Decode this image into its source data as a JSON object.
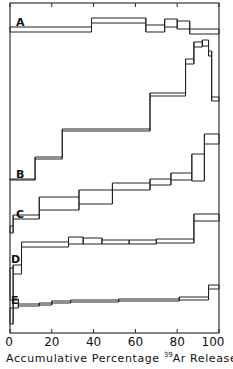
{
  "chart_data": {
    "type": "line",
    "subtype": "step (age spectra, stacked panels)",
    "title": "",
    "xlabel_prefix": "Accumulative Percentage ",
    "xlabel_sup": "39",
    "xlabel_suffix": "Ar Released",
    "ylabel": "",
    "xlim": [
      0,
      100
    ],
    "x_ticks": [
      0,
      20,
      40,
      60,
      80,
      100
    ],
    "x_tick_labels": [
      "0",
      "20",
      "40",
      "60",
      "80",
      "100"
    ],
    "grid": false,
    "legend": "none",
    "note": "Step boxes: each step spans [x0,x1] in % 39Ar released; y values are pixel-relative vertical positions (no y-axis scale shown). Each step is drawn as a box with top and bottom error bounds.",
    "series": [
      {
        "name": "A",
        "label_pos": [
          16,
          16
        ],
        "steps": [
          {
            "x0": 0,
            "x1": 39,
            "top": 27,
            "bot": 32
          },
          {
            "x0": 39,
            "x1": 65,
            "top": 18,
            "bot": 23
          },
          {
            "x0": 65,
            "x1": 74,
            "top": 25,
            "bot": 32
          },
          {
            "x0": 74,
            "x1": 80,
            "top": 19,
            "bot": 27
          },
          {
            "x0": 80,
            "x1": 86,
            "top": 21,
            "bot": 29
          },
          {
            "x0": 86,
            "x1": 100,
            "top": 29,
            "bot": 34
          }
        ]
      },
      {
        "name": "B",
        "label_pos": [
          16,
          168
        ],
        "steps": [
          {
            "x0": 0,
            "x1": 12,
            "top": 179,
            "bot": 180
          },
          {
            "x0": 12,
            "x1": 25,
            "top": 157,
            "bot": 159
          },
          {
            "x0": 25,
            "x1": 67,
            "top": 129,
            "bot": 131
          },
          {
            "x0": 67,
            "x1": 84,
            "top": 93,
            "bot": 96
          },
          {
            "x0": 84,
            "x1": 88,
            "top": 59,
            "bot": 64
          },
          {
            "x0": 88,
            "x1": 92,
            "top": 42,
            "bot": 47
          },
          {
            "x0": 92,
            "x1": 95,
            "top": 40,
            "bot": 46
          },
          {
            "x0": 95,
            "x1": 96.5,
            "top": 51,
            "bot": 56
          },
          {
            "x0": 96.5,
            "x1": 100,
            "top": 97,
            "bot": 101
          }
        ]
      },
      {
        "name": "C",
        "label_pos": [
          16,
          208
        ],
        "steps": [
          {
            "x0": 0,
            "x1": 1.5,
            "top": 226,
            "bot": 233
          },
          {
            "x0": 1.5,
            "x1": 14,
            "top": 215,
            "bot": 219
          },
          {
            "x0": 14,
            "x1": 33,
            "top": 197,
            "bot": 210
          },
          {
            "x0": 33,
            "x1": 49,
            "top": 190,
            "bot": 204
          },
          {
            "x0": 49,
            "x1": 67,
            "top": 183,
            "bot": 190
          },
          {
            "x0": 67,
            "x1": 77,
            "top": 179,
            "bot": 185
          },
          {
            "x0": 77,
            "x1": 87,
            "top": 173,
            "bot": 180
          },
          {
            "x0": 87,
            "x1": 93,
            "top": 154,
            "bot": 181
          },
          {
            "x0": 93,
            "x1": 100,
            "top": 134,
            "bot": 144
          }
        ]
      },
      {
        "name": "D",
        "label_pos": [
          11,
          253
        ],
        "steps": [
          {
            "x0": 0,
            "x1": 1.5,
            "top": 268,
            "bot": 300
          },
          {
            "x0": 1.5,
            "x1": 5.5,
            "top": 265,
            "bot": 274
          },
          {
            "x0": 5.5,
            "x1": 28,
            "top": 242,
            "bot": 247
          },
          {
            "x0": 28,
            "x1": 35,
            "top": 237,
            "bot": 244
          },
          {
            "x0": 35,
            "x1": 44,
            "top": 238,
            "bot": 244
          },
          {
            "x0": 44,
            "x1": 57,
            "top": 240,
            "bot": 244
          },
          {
            "x0": 57,
            "x1": 70,
            "top": 240,
            "bot": 244
          },
          {
            "x0": 70,
            "x1": 88,
            "top": 239,
            "bot": 243
          },
          {
            "x0": 88,
            "x1": 100,
            "top": 214,
            "bot": 221
          }
        ]
      },
      {
        "name": "E",
        "label_pos": [
          11,
          294
        ],
        "steps": [
          {
            "x0": 0,
            "x1": 1.5,
            "top": 308,
            "bot": 324
          },
          {
            "x0": 1.5,
            "x1": 4,
            "top": 299,
            "bot": 308
          },
          {
            "x0": 4,
            "x1": 14,
            "top": 304,
            "bot": 306
          },
          {
            "x0": 14,
            "x1": 20,
            "top": 303,
            "bot": 305
          },
          {
            "x0": 20,
            "x1": 29,
            "top": 301,
            "bot": 303
          },
          {
            "x0": 29,
            "x1": 52,
            "top": 300,
            "bot": 302
          },
          {
            "x0": 52,
            "x1": 81,
            "top": 299,
            "bot": 301
          },
          {
            "x0": 81,
            "x1": 95,
            "top": 297,
            "bot": 300
          },
          {
            "x0": 95,
            "x1": 100,
            "top": 285,
            "bot": 289
          }
        ]
      }
    ]
  },
  "frame": {
    "left_px": 10,
    "right_px": 219,
    "top_px": 3,
    "bottom_px": 333,
    "line_color": "#222222",
    "background": "#ffffff"
  }
}
